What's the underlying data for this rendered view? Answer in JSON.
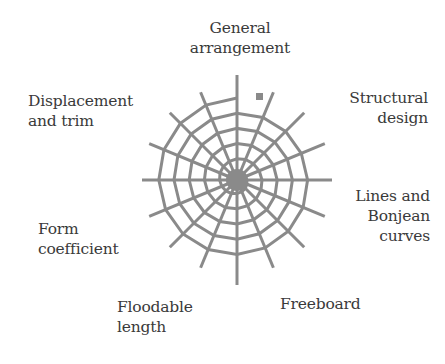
{
  "diagram": {
    "line_color": "#8a8a8a",
    "text_color": "#3a3a3a",
    "center": {
      "x": 237,
      "y": 180
    },
    "spokes": 16,
    "labels": [
      {
        "id": "general-arrangement",
        "lines": [
          "General",
          "arrangement"
        ]
      },
      {
        "id": "structural-design",
        "lines": [
          "Structural",
          "design"
        ]
      },
      {
        "id": "lines-and-bonjean-curves",
        "lines": [
          "Lines and",
          "Bonjean",
          "curves"
        ]
      },
      {
        "id": "freeboard",
        "lines": [
          "Freeboard"
        ]
      },
      {
        "id": "floodable-length",
        "lines": [
          "Floodable",
          "length"
        ]
      },
      {
        "id": "form-coefficient",
        "lines": [
          "Form",
          "coefficient"
        ]
      },
      {
        "id": "displacement-and-trim",
        "lines": [
          "Displacement",
          "and trim"
        ]
      }
    ]
  }
}
